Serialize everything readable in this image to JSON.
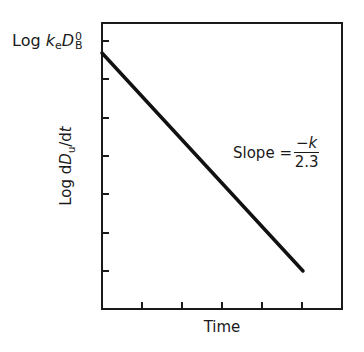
{
  "chart_data": {
    "type": "line",
    "title": "",
    "xlabel": "Time",
    "ylabel": "Log dD_u/dt",
    "x_ticks": 5,
    "y_ticks": 7,
    "x_tick_labels": [],
    "y_tick_labels": [],
    "grid": false,
    "legend": null,
    "axis_scale": {
      "y": "log",
      "x": "linear"
    },
    "series": [
      {
        "name": "Log dD_u/dt vs Time",
        "x": [
          0,
          5
        ],
        "y": [
          0.82,
          -4.82
        ],
        "style": {
          "color": "#111111",
          "width": 3.5
        }
      }
    ],
    "annotations": [
      {
        "text": "Log k_e D_B^0",
        "position": "y-intercept",
        "meaning": "initial value at t=0"
      },
      {
        "text": "Slope = -k/2.3",
        "position": "mid-line right"
      }
    ],
    "xlim": [
      0,
      6
    ],
    "ylim": [
      -6,
      1
    ]
  },
  "labels": {
    "intercept": {
      "prefix": "Log ",
      "k": "k",
      "e": "e",
      "D": "D",
      "sup": "0",
      "sub": "B"
    },
    "y_axis": {
      "prefix": "Log d",
      "D": "D",
      "sub": "u",
      "suffix": "/d",
      "t": "t"
    },
    "x_axis": "Time",
    "slope": {
      "text": "Slope =",
      "num_sign": "−",
      "num_var": "k",
      "den": "2.3"
    }
  },
  "geometry": {
    "frame": {
      "left": 102,
      "top": 23,
      "right": 342,
      "bottom": 309
    },
    "y_ticks_px": [
      41,
      79,
      118,
      156,
      194,
      233,
      271
    ],
    "x_ticks_px": [
      142,
      182,
      222,
      262,
      302
    ],
    "line": {
      "x1": 102,
      "y1": 53,
      "x2": 303,
      "y2": 271
    }
  }
}
